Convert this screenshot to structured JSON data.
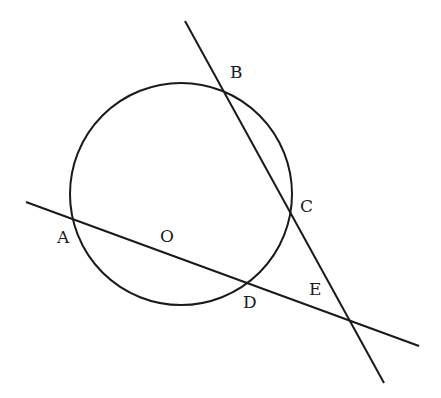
{
  "diagram": {
    "type": "geometry",
    "circle": {
      "center_label": "O",
      "cx": 181,
      "cy": 194,
      "r": 111
    },
    "lines": [
      {
        "name": "line-AOD-E",
        "x1": 26,
        "y1": 202,
        "x2": 419,
        "y2": 346
      },
      {
        "name": "line-BC-E",
        "x1": 185,
        "y1": 21,
        "x2": 384,
        "y2": 383
      }
    ],
    "labels": {
      "A": "A",
      "B": "B",
      "C": "C",
      "D": "D",
      "E": "E",
      "O": "O"
    },
    "stroke_color": "#1a1a1a"
  }
}
